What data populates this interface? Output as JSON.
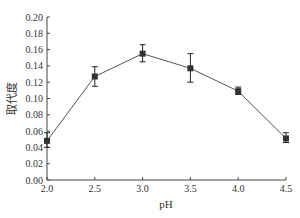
{
  "chart_data": {
    "type": "line",
    "title": "",
    "xlabel": "pH",
    "ylabel": "取代度",
    "x": [
      2.0,
      2.5,
      3.0,
      3.5,
      4.0,
      4.5
    ],
    "x_tick_labels": [
      "2.0",
      "2.5",
      "3.0",
      "3.5",
      "4.0",
      "4.5"
    ],
    "y_tick_labels": [
      "0.00",
      "0.02",
      "0.04",
      "0.06",
      "0.08",
      "0.10",
      "0.12",
      "0.14",
      "0.16",
      "0.18",
      "0.20"
    ],
    "series": [
      {
        "name": "取代度",
        "values": [
          0.048,
          0.127,
          0.155,
          0.137,
          0.109,
          0.051
        ],
        "error_low": [
          0.04,
          0.115,
          0.145,
          0.12,
          0.105,
          0.046
        ],
        "error_high": [
          0.058,
          0.139,
          0.166,
          0.155,
          0.114,
          0.058
        ],
        "marker": "square",
        "color": "#333333"
      }
    ],
    "xlim": [
      2.0,
      4.5
    ],
    "ylim": [
      0.0,
      0.2
    ],
    "grid": false,
    "legend": "none"
  }
}
